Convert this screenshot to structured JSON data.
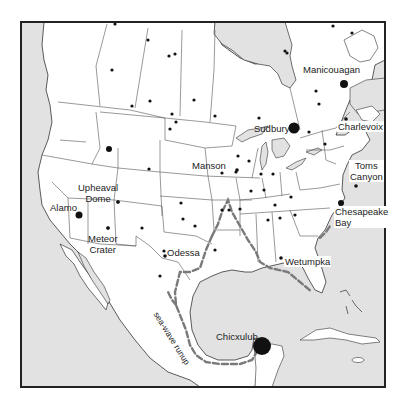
{
  "map": {
    "title": "North American impact craters",
    "colors": {
      "land": "#ffffff",
      "water": "#e2e2e2",
      "border": "#444444",
      "frame": "#222222",
      "crater": "#111111",
      "runup": "#777777"
    },
    "craters": [
      {
        "name": "Manicouagan",
        "label": "Manicouagan",
        "size": "large"
      },
      {
        "name": "Sudbury",
        "label": "Sudbury",
        "size": "large"
      },
      {
        "name": "Charlevoix",
        "label": "Charlevoix",
        "size": "small"
      },
      {
        "name": "Toms Canyon",
        "label_line1": "Toms",
        "label_line2": "Canyon",
        "size": "small"
      },
      {
        "name": "Chesapeake Bay",
        "label_line1": "Chesapeake",
        "label_line2": "Bay",
        "size": "medium"
      },
      {
        "name": "Manson",
        "label": "Manson",
        "size": "small"
      },
      {
        "name": "Upheaval Dome",
        "label_line1": "Upheaval",
        "label_line2": "Dome",
        "size": "small"
      },
      {
        "name": "Alamo",
        "label": "Alamo",
        "size": "medium"
      },
      {
        "name": "Meteor Crater",
        "label_line1": "Meteor",
        "label_line2": "Crater",
        "size": "small"
      },
      {
        "name": "Odessa",
        "label": "Odessa",
        "size": "small"
      },
      {
        "name": "Wetumpka",
        "label": "Wetumpka",
        "size": "small"
      },
      {
        "name": "Chicxulub",
        "label": "Chicxulub",
        "size": "very-large"
      }
    ],
    "annotation": {
      "runup_label": "sea-wave runup"
    },
    "legend_symbols": {
      "crater": "filled-circle",
      "runup": "dashed-line"
    }
  }
}
